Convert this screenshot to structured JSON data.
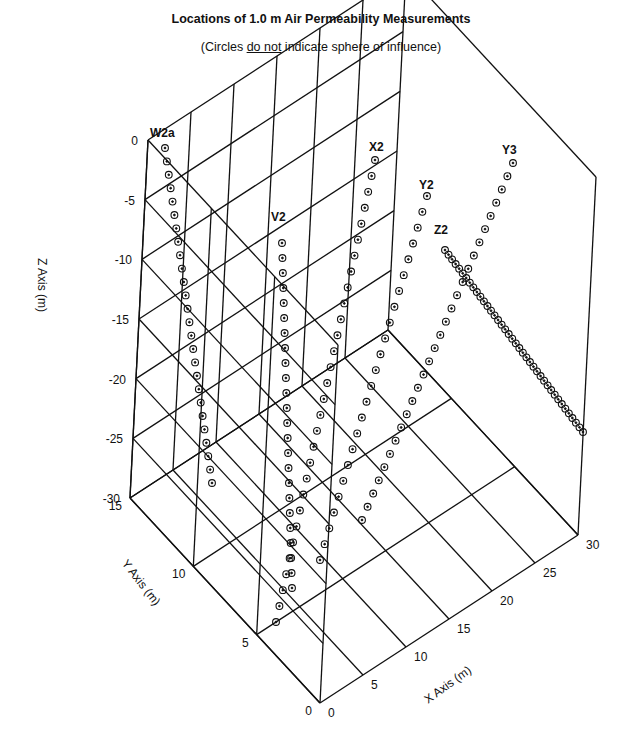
{
  "chart_data": {
    "type": "scatter",
    "dimensions": 3,
    "title": "Locations of 1.0 m Air Permeability Measurements",
    "subtitle_parts": [
      "(Circles ",
      "do not",
      " indicate sphere of influence)"
    ],
    "xlabel": "X Axis (m)",
    "ylabel": "Y Axis (m)",
    "zlabel": "Z Axis (m)",
    "xlim": [
      0,
      30
    ],
    "ylim": [
      0,
      15
    ],
    "zlim": [
      -30,
      0
    ],
    "x_ticks": [
      "0",
      "5",
      "10",
      "15",
      "20",
      "25",
      "30"
    ],
    "y_ticks": [
      "0",
      "5",
      "10",
      "15"
    ],
    "z_ticks": [
      "0",
      "-5",
      "-10",
      "-15",
      "-20",
      "-25",
      "-30"
    ],
    "grid": true,
    "marker": "circle-with-dot",
    "series": [
      {
        "name": "W2a",
        "note": "inclined borehole descending from near surface toward front"
      },
      {
        "name": "V2",
        "note": "near-vertical borehole"
      },
      {
        "name": "X2",
        "note": "inclined borehole"
      },
      {
        "name": "Y2",
        "note": "inclined borehole"
      },
      {
        "name": "Y3",
        "note": "inclined borehole"
      },
      {
        "name": "Z2",
        "note": "inclined borehole toward far x side, dense 1.0 m spacing"
      }
    ]
  },
  "labels": {
    "title": "Locations of 1.0 m Air Permeability Measurements",
    "subtitle_pre": "(Circles ",
    "subtitle_under": "do not",
    "subtitle_post": " indicate sphere of influence)",
    "z_axis": "Z Axis (m)",
    "y_axis": "Y Axis (m)",
    "x_axis": "X Axis (m)",
    "wells": {
      "W2a": "W2a",
      "V2": "V2",
      "X2": "X2",
      "Y2": "Y2",
      "Y3": "Y3",
      "Z2": "Z2"
    }
  }
}
